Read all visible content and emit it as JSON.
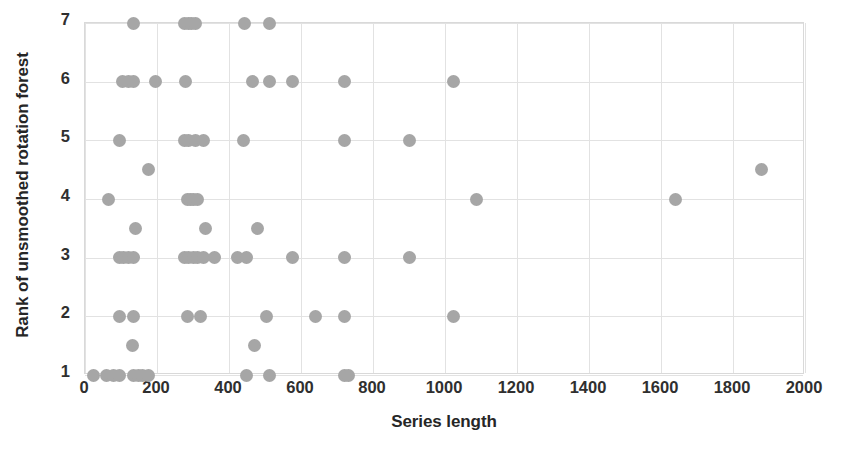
{
  "chart_data": {
    "type": "scatter",
    "title": "",
    "xlabel": "Series length",
    "ylabel": "Rank of unsmoothed rotation forest",
    "xlim": [
      0,
      2000
    ],
    "ylim": [
      1,
      7
    ],
    "xticks": [
      0,
      200,
      400,
      600,
      800,
      1000,
      1200,
      1400,
      1600,
      1800,
      2000
    ],
    "yticks": [
      1,
      2,
      3,
      4,
      5,
      6,
      7
    ],
    "grid": true,
    "legend": null,
    "marker": {
      "shape": "circle",
      "color": "#a6a6a6",
      "size_px": 13
    },
    "series": [
      {
        "name": "datasets",
        "points": [
          [
            24,
            1
          ],
          [
            60,
            1
          ],
          [
            80,
            1
          ],
          [
            96,
            1
          ],
          [
            136,
            1
          ],
          [
            148,
            1
          ],
          [
            160,
            1
          ],
          [
            176,
            1
          ],
          [
            448,
            1
          ],
          [
            512,
            1
          ],
          [
            720,
            1
          ],
          [
            732,
            1
          ],
          [
            132,
            1.5
          ],
          [
            470,
            1.5
          ],
          [
            96,
            2
          ],
          [
            136,
            2
          ],
          [
            286,
            2
          ],
          [
            320,
            2
          ],
          [
            504,
            2
          ],
          [
            640,
            2
          ],
          [
            720,
            2
          ],
          [
            1024,
            2
          ],
          [
            96,
            3
          ],
          [
            108,
            3
          ],
          [
            120,
            3
          ],
          [
            136,
            3
          ],
          [
            276,
            3
          ],
          [
            288,
            3
          ],
          [
            300,
            3
          ],
          [
            312,
            3
          ],
          [
            330,
            3
          ],
          [
            360,
            3
          ],
          [
            424,
            3
          ],
          [
            448,
            3
          ],
          [
            576,
            3
          ],
          [
            720,
            3
          ],
          [
            900,
            3
          ],
          [
            140,
            3.5
          ],
          [
            336,
            3.5
          ],
          [
            480,
            3.5
          ],
          [
            64,
            4
          ],
          [
            286,
            4
          ],
          [
            292,
            4
          ],
          [
            300,
            4
          ],
          [
            312,
            4
          ],
          [
            1088,
            4
          ],
          [
            1640,
            4
          ],
          [
            1880,
            4.5
          ],
          [
            176,
            4.5
          ],
          [
            96,
            5
          ],
          [
            276,
            5
          ],
          [
            288,
            5
          ],
          [
            306,
            5
          ],
          [
            330,
            5
          ],
          [
            440,
            5
          ],
          [
            720,
            5
          ],
          [
            900,
            5
          ],
          [
            104,
            6
          ],
          [
            120,
            6
          ],
          [
            136,
            6
          ],
          [
            196,
            6
          ],
          [
            280,
            6
          ],
          [
            464,
            6
          ],
          [
            512,
            6
          ],
          [
            576,
            6
          ],
          [
            720,
            6
          ],
          [
            1024,
            6
          ],
          [
            136,
            7
          ],
          [
            276,
            7
          ],
          [
            288,
            7
          ],
          [
            296,
            7
          ],
          [
            306,
            7
          ],
          [
            444,
            7
          ],
          [
            512,
            7
          ]
        ]
      }
    ]
  }
}
